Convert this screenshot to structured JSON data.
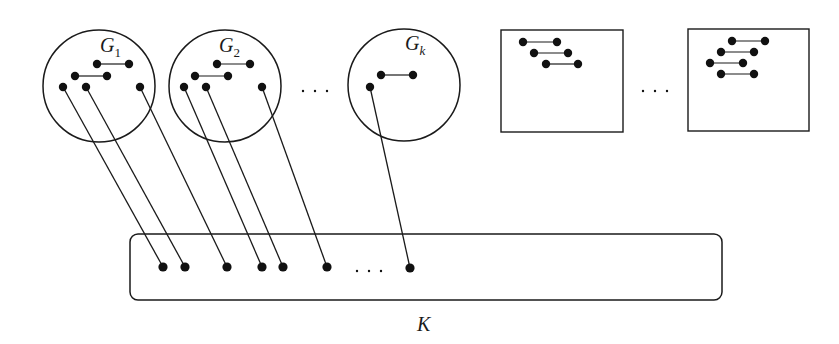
{
  "diagram": {
    "stroke_color": "#1a1a1a",
    "node_color": "#111111",
    "background": "#ffffff",
    "groups": [
      {
        "id": "G1",
        "label": "G",
        "subscript": "1",
        "shape": "circle",
        "cx": 99,
        "cy": 86,
        "r": 56,
        "label_x": 100,
        "label_y": 52,
        "edges": [
          [
            [
              97,
              64
            ],
            [
              129,
              64
            ]
          ],
          [
            [
              75,
              76
            ],
            [
              107,
              76
            ]
          ]
        ],
        "nodes": [
          [
            97,
            64
          ],
          [
            129,
            64
          ],
          [
            75,
            76
          ],
          [
            107,
            76
          ],
          [
            63,
            87
          ],
          [
            86,
            87
          ],
          [
            140,
            87
          ]
        ]
      },
      {
        "id": "G2",
        "label": "G",
        "subscript": "2",
        "shape": "circle",
        "cx": 225,
        "cy": 86,
        "r": 56,
        "label_x": 219,
        "label_y": 52,
        "edges": [
          [
            [
              217,
              64
            ],
            [
              250,
              64
            ]
          ],
          [
            [
              195,
              76
            ],
            [
              228,
              76
            ]
          ]
        ],
        "nodes": [
          [
            217,
            64
          ],
          [
            250,
            64
          ],
          [
            195,
            76
          ],
          [
            228,
            76
          ],
          [
            184,
            87
          ],
          [
            206,
            87
          ],
          [
            262,
            87
          ]
        ]
      },
      {
        "id": "Gk",
        "label": "G",
        "subscript": "k",
        "shape": "circle",
        "cx": 404,
        "cy": 85,
        "r": 56,
        "label_x": 405,
        "label_y": 50,
        "edges": [
          [
            [
              381,
              75
            ],
            [
              413,
              75
            ]
          ]
        ],
        "nodes": [
          [
            381,
            75
          ],
          [
            413,
            75
          ],
          [
            370,
            87
          ]
        ]
      }
    ],
    "boxes": [
      {
        "id": "box-1",
        "x": 501,
        "y": 30,
        "w": 122,
        "h": 102,
        "edges": [
          [
            [
              523,
              42
            ],
            [
              557,
              42
            ]
          ],
          [
            [
              534,
              53
            ],
            [
              568,
              53
            ]
          ],
          [
            [
              546,
              64
            ],
            [
              578,
              64
            ]
          ]
        ],
        "nodes": [
          [
            523,
            42
          ],
          [
            557,
            42
          ],
          [
            534,
            53
          ],
          [
            568,
            53
          ],
          [
            546,
            64
          ],
          [
            578,
            64
          ]
        ]
      },
      {
        "id": "box-2",
        "x": 688,
        "y": 29,
        "w": 121,
        "h": 102,
        "edges": [
          [
            [
              732,
              41
            ],
            [
              765,
              41
            ]
          ],
          [
            [
              721,
              52
            ],
            [
              754,
              52
            ]
          ],
          [
            [
              710,
              63
            ],
            [
              743,
              63
            ]
          ],
          [
            [
              721,
              74
            ],
            [
              754,
              74
            ]
          ]
        ],
        "nodes": [
          [
            732,
            41
          ],
          [
            765,
            41
          ],
          [
            721,
            52
          ],
          [
            754,
            52
          ],
          [
            710,
            63
          ],
          [
            743,
            63
          ],
          [
            721,
            74
          ],
          [
            754,
            74
          ]
        ]
      }
    ],
    "ellipses": [
      {
        "id": "ellipsis-groups",
        "x": 303,
        "y": 91,
        "text": "· · ·"
      },
      {
        "id": "ellipsis-boxes",
        "x": 643,
        "y": 91,
        "text": "· · ·"
      },
      {
        "id": "ellipsis-K",
        "x": 357,
        "y": 271,
        "text": "· · ·"
      }
    ],
    "K": {
      "label": "K",
      "x": 130,
      "y": 234,
      "w": 592,
      "h": 66,
      "rx": 8,
      "label_x": 417,
      "label_y": 331,
      "nodes": [
        [
          163,
          267
        ],
        [
          185,
          267
        ],
        [
          227,
          267
        ],
        [
          262,
          267
        ],
        [
          283,
          267
        ],
        [
          327,
          267
        ],
        [
          410,
          268
        ]
      ]
    },
    "connections": [
      [
        [
          63,
          87
        ],
        [
          163,
          267
        ]
      ],
      [
        [
          86,
          87
        ],
        [
          185,
          267
        ]
      ],
      [
        [
          140,
          87
        ],
        [
          227,
          267
        ]
      ],
      [
        [
          184,
          87
        ],
        [
          262,
          267
        ]
      ],
      [
        [
          206,
          87
        ],
        [
          283,
          267
        ]
      ],
      [
        [
          262,
          87
        ],
        [
          327,
          267
        ]
      ],
      [
        [
          370,
          87
        ],
        [
          410,
          268
        ]
      ]
    ]
  }
}
